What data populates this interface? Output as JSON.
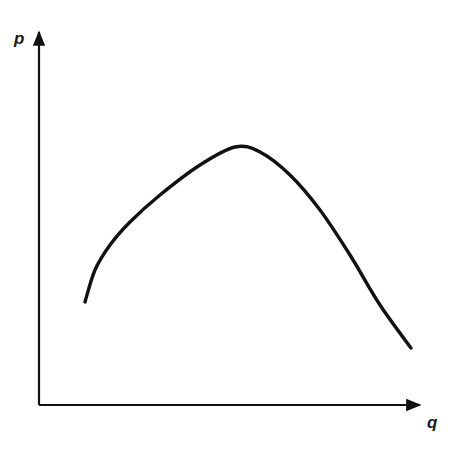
{
  "chart_data": {
    "type": "line",
    "title": "",
    "xlabel": "q",
    "ylabel": "p",
    "grid": false,
    "legend": null,
    "ticks": {
      "x": [],
      "y": []
    },
    "series": [
      {
        "name": "p(q)",
        "x": [
          0.12,
          0.148,
          0.186,
          0.239,
          0.317,
          0.422,
          0.513,
          0.579,
          0.657,
          0.735,
          0.813,
          0.892,
          0.974
        ],
        "y": [
          0.27,
          0.36,
          0.43,
          0.49,
          0.56,
          0.64,
          0.69,
          0.68,
          0.61,
          0.52,
          0.4,
          0.27,
          0.15
        ]
      }
    ],
    "pixel_path": [
      [
        85,
        302
      ],
      [
        95,
        270
      ],
      [
        110,
        245
      ],
      [
        130,
        222
      ],
      [
        160,
        195
      ],
      [
        200,
        165
      ],
      [
        235,
        147
      ],
      [
        260,
        152
      ],
      [
        290,
        175
      ],
      [
        320,
        210
      ],
      [
        350,
        255
      ],
      [
        380,
        305
      ],
      [
        411,
        348
      ]
    ],
    "color": "#111111"
  },
  "labels": {
    "y_axis": "p",
    "x_axis": "q"
  }
}
